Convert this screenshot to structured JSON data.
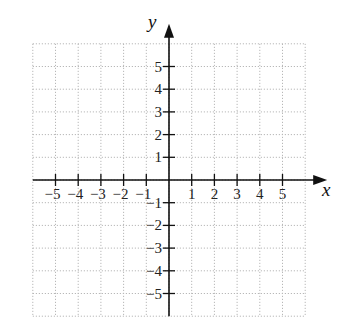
{
  "chart_data": {
    "type": "scatter",
    "title": "",
    "xlabel": "x",
    "ylabel": "y",
    "xlim": [
      -6,
      6
    ],
    "ylim": [
      -6,
      6
    ],
    "grid": true,
    "grid_style": "dotted",
    "x_ticks": [
      -5,
      -4,
      -3,
      -2,
      -1,
      1,
      2,
      3,
      4,
      5
    ],
    "y_ticks": [
      -5,
      -4,
      -3,
      -2,
      -1,
      1,
      2,
      3,
      4,
      5
    ],
    "x_tick_labels": [
      "−5",
      "−4",
      "−3",
      "−2",
      "−1",
      "1",
      "2",
      "3",
      "4",
      "5"
    ],
    "y_tick_labels": [
      "−5",
      "−4",
      "−3",
      "−2",
      "−1",
      "1",
      "2",
      "3",
      "4",
      "5"
    ],
    "series": [],
    "legend": null
  },
  "colors": {
    "axis": "#111111",
    "grid": "#b8b8b8",
    "background": "#ffffff"
  }
}
